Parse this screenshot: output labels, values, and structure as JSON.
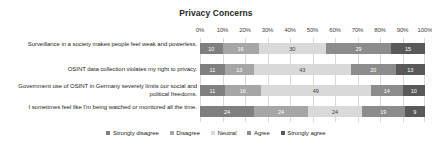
{
  "chart_data": {
    "type": "bar",
    "subtype": "stacked-horizontal-100",
    "title": "Privacy Concerns",
    "xlabel": "",
    "ylabel": "",
    "xlim": [
      0,
      100
    ],
    "grid": true,
    "legend_position": "bottom",
    "tick_labels": [
      "0%",
      "10%",
      "20%",
      "30%",
      "40%",
      "50%",
      "60%",
      "70%",
      "80%",
      "90%",
      "100%"
    ],
    "tick_values": [
      0,
      10,
      20,
      30,
      40,
      50,
      60,
      70,
      80,
      90,
      100
    ],
    "categories": [
      "Surveillance in a society makes people feel weak and powerless.",
      "OSINT data collection violates my right to privacy.",
      "Government use of OSINT in Germany severely limits our social and political freedoms.",
      "I sometimes feel like I'm being watched or monitored all the time."
    ],
    "series": [
      {
        "name": "Strongly disagree",
        "color": "#808080",
        "values": [
          10,
          11,
          11,
          24
        ]
      },
      {
        "name": "Disagree",
        "color": "#a6a6a6",
        "values": [
          16,
          13,
          16,
          24
        ]
      },
      {
        "name": "Neutral",
        "color": "#d9d9d9",
        "values": [
          30,
          43,
          49,
          24
        ]
      },
      {
        "name": "Agree",
        "color": "#8c8c8c",
        "values": [
          29,
          20,
          14,
          19
        ]
      },
      {
        "name": "Strongly agree",
        "color": "#595959",
        "values": [
          15,
          13,
          10,
          9
        ]
      }
    ]
  },
  "colors": {
    "background": "#ffffff",
    "text": "#262626",
    "gridline": "#d9d9d9",
    "plot_border": "#d9d9d9"
  }
}
